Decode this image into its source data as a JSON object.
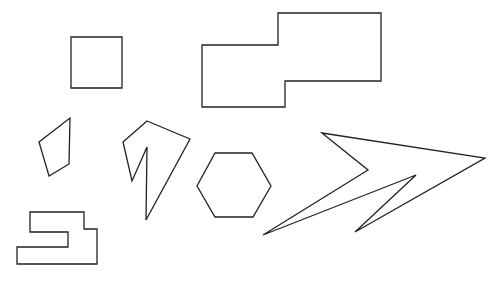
{
  "canvas": {
    "width": 504,
    "height": 281,
    "background": "#ffffff"
  },
  "style": {
    "stroke": "#222222",
    "stroke_width": 1.3
  },
  "shapes": [
    {
      "name": "square",
      "points": "71,37 122,37 122,88 71,88"
    },
    {
      "name": "stepped-rectangle",
      "points": "202,45 278,45 278,13 381,13 381,81 285,81 285,107 202,107"
    },
    {
      "name": "quadrilateral",
      "points": "70,118 69,164 49,176 39,142"
    },
    {
      "name": "concave-polygon",
      "points": "147,121 190,139 146,220 147,147 132,181 123,142"
    },
    {
      "name": "hexagon",
      "points": "215,153 252,153 271,186 253,217 215,217 197,186"
    },
    {
      "name": "zigzag-arrow",
      "points": "322,133 485,158 355,232 416,175 263,235 368,170"
    },
    {
      "name": "bracket-shape",
      "points": "30,212 84,212 84,229 97,229 97,264 17,264 17,247 68,247 68,232 30,232"
    }
  ]
}
